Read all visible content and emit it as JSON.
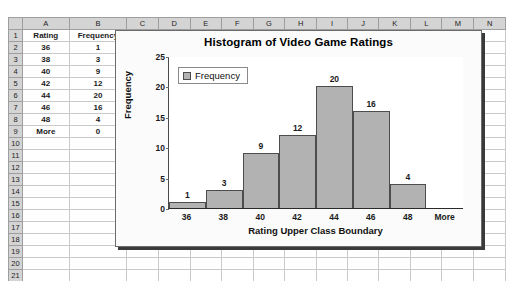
{
  "spreadsheet": {
    "column_headers": [
      "A",
      "B",
      "C",
      "D",
      "E",
      "F",
      "G",
      "H",
      "I",
      "J",
      "K",
      "L",
      "M",
      "N"
    ],
    "row_headers": [
      "1",
      "2",
      "3",
      "4",
      "5",
      "6",
      "7",
      "8",
      "9",
      "10",
      "11",
      "12",
      "13",
      "14",
      "15",
      "16",
      "17",
      "18",
      "19",
      "20",
      "21",
      "22"
    ],
    "cells": {
      "A1": "Rating",
      "B1": "Frequency",
      "A2": "36",
      "B2": "1",
      "A3": "38",
      "B3": "3",
      "A4": "40",
      "B4": "9",
      "A5": "42",
      "B5": "12",
      "A6": "44",
      "B6": "20",
      "A7": "46",
      "B7": "16",
      "A8": "48",
      "B8": "4",
      "A9": "More",
      "B9": "0"
    }
  },
  "chart_data": {
    "type": "bar",
    "title": "Histogram of Video Game Ratings",
    "xlabel": "Rating Upper Class Boundary",
    "ylabel": "Frequency",
    "categories": [
      "36",
      "38",
      "40",
      "42",
      "44",
      "46",
      "48",
      "More"
    ],
    "values": [
      1,
      3,
      9,
      12,
      20,
      16,
      4,
      0
    ],
    "data_labels": [
      "1",
      "3",
      "9",
      "12",
      "20",
      "16",
      "4",
      ""
    ],
    "ylim": [
      0,
      25
    ],
    "yticks": [
      0,
      5,
      10,
      15,
      20,
      25
    ],
    "ytick_labels": [
      "0",
      "5",
      "10",
      "15",
      "20",
      "25"
    ],
    "grid": false,
    "legend": {
      "position": "top-left-inside",
      "entries": [
        "Frequency"
      ]
    },
    "series": [
      {
        "name": "Frequency",
        "values": [
          1,
          3,
          9,
          12,
          20,
          16,
          4,
          0
        ]
      }
    ],
    "colors": {
      "bar_fill": "#b2b2b2",
      "bar_border": "#4d4d4d",
      "plot_background": "#ffffff",
      "chart_background": "#fbfbfb"
    }
  }
}
